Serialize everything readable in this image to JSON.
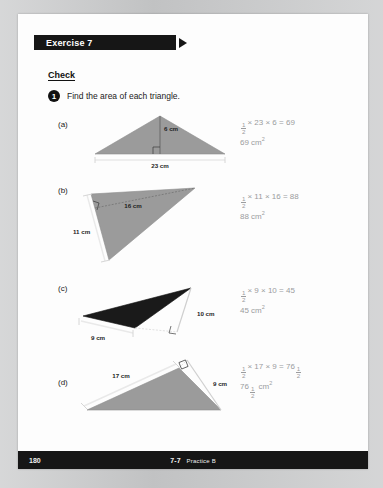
{
  "page": {
    "banner_title": "Exercise 7",
    "check_heading": "Check",
    "instruction_number": "1",
    "instruction_text": "Find the area of each triangle.",
    "footer_page_number": "180",
    "footer_lesson": "7-7",
    "footer_practice": "Practice B"
  },
  "colors": {
    "banner_bg": "#161616",
    "page_bg": "#fdfdfd",
    "board_bg": "#c9cacb",
    "triangle_gray": "#9b9b9b",
    "triangle_black": "#1a1a1a",
    "answer_gray": "#9b9c9e"
  },
  "problems": [
    {
      "label": "(a)",
      "fill": "gray",
      "height_label": "6 cm",
      "base_label": "23 cm",
      "answer_line1_pre": "",
      "answer_line1": "× 23 × 6 = 69",
      "answer_line2": "69 cm",
      "answer_unit_sup": "2",
      "base_value": 23,
      "height_value": 6,
      "area": 69
    },
    {
      "label": "(b)",
      "fill": "gray",
      "height_label": "16 cm",
      "base_label": "11 cm",
      "answer_line1": "× 11 × 16 = 88",
      "answer_line2": "88 cm",
      "answer_unit_sup": "2",
      "base_value": 11,
      "height_value": 16,
      "area": 88
    },
    {
      "label": "(c)",
      "fill": "black",
      "height_label": "10 cm",
      "base_label": "9 cm",
      "answer_line1": "× 9 × 10 = 45",
      "answer_line2": "45 cm",
      "answer_unit_sup": "2",
      "base_value": 9,
      "height_value": 10,
      "area": 45
    },
    {
      "label": "(d)",
      "fill": "gray",
      "height_label": "9 cm",
      "base_label": "17 cm",
      "answer_line1": "× 17 × 9 = 76",
      "answer_line2": "76",
      "answer_unit": "cm",
      "answer_unit_sup": "2",
      "base_value": 17,
      "height_value": 9,
      "area": 76.5
    }
  ]
}
